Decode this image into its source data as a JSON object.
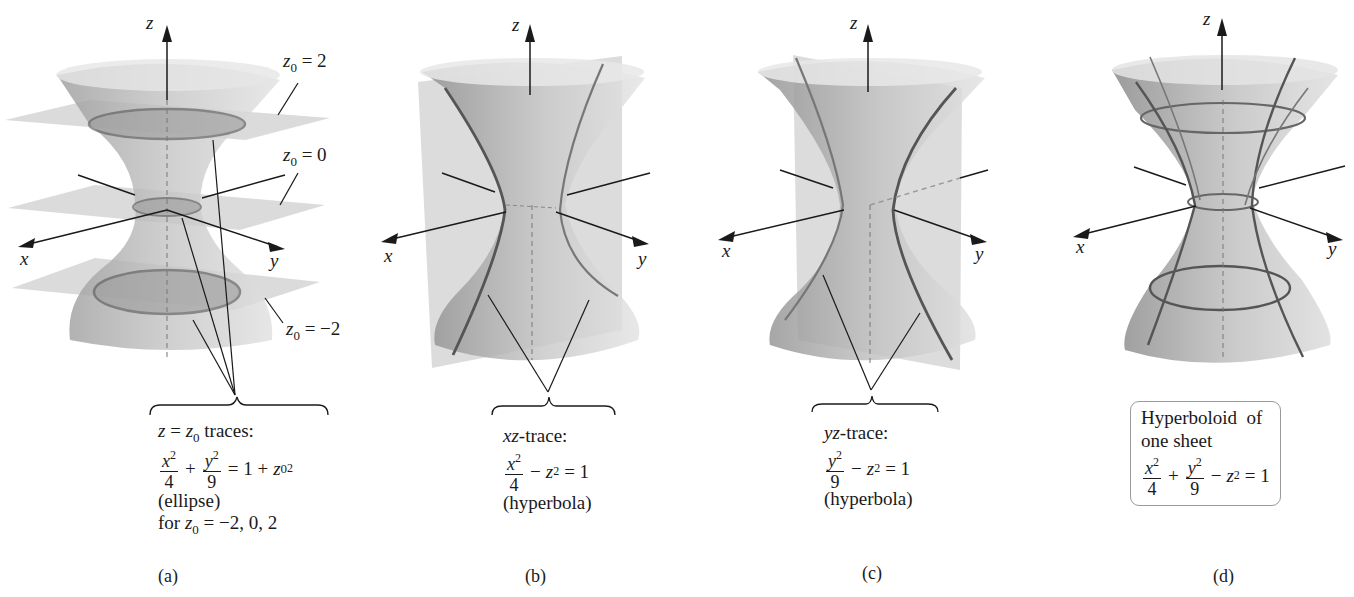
{
  "figure": {
    "panels": [
      {
        "id": "a",
        "caption": "(a)",
        "axes": {
          "x": "x",
          "y": "y",
          "z": "z"
        },
        "plane_labels": [
          {
            "var": "z",
            "sub": "0",
            "rest": "= 2"
          },
          {
            "var": "z",
            "sub": "0",
            "rest": "= 0"
          },
          {
            "var": "z",
            "sub": "0",
            "rest": "= −2"
          }
        ],
        "annotation": {
          "line1_var": "z",
          "line1_eq": "=",
          "line1_sub_var": "z",
          "line1_sub": "0",
          "line1_rest": "traces:",
          "frac1_num": "x",
          "frac1_num_sup": "2",
          "frac1_den": "4",
          "plus": "+",
          "frac2_num": "y",
          "frac2_num_sup": "2",
          "frac2_den": "9",
          "rhs": "= 1 +",
          "rhs_var": "z",
          "rhs_sub": "0",
          "rhs_sup": "2",
          "type": "(ellipse)",
          "for_text": "for",
          "for_var": "z",
          "for_sub": "0",
          "for_rest": "= −2, 0, 2"
        }
      },
      {
        "id": "b",
        "caption": "(b)",
        "axes": {
          "x": "x",
          "y": "y",
          "z": "z"
        },
        "annotation": {
          "title_var": "xz",
          "title_rest": "-trace:",
          "frac_num": "x",
          "frac_num_sup": "2",
          "frac_den": "4",
          "minus": "−",
          "z_var": "z",
          "z_sup": "2",
          "rhs": "= 1",
          "type": "(hyperbola)"
        }
      },
      {
        "id": "c",
        "caption": "(c)",
        "axes": {
          "x": "x",
          "y": "y",
          "z": "z"
        },
        "annotation": {
          "title_var": "yz",
          "title_rest": "-trace:",
          "frac_num": "y",
          "frac_num_sup": "2",
          "frac_den": "9",
          "minus": "−",
          "z_var": "z",
          "z_sup": "2",
          "rhs": "= 1",
          "type": "(hyperbola)"
        }
      },
      {
        "id": "d",
        "caption": "(d)",
        "axes": {
          "x": "x",
          "y": "y",
          "z": "z"
        },
        "box": {
          "line1": "Hyperboloid  of",
          "line2": "one sheet",
          "frac1_num": "x",
          "frac1_num_sup": "2",
          "frac1_den": "4",
          "plus": "+",
          "frac2_num": "y",
          "frac2_num_sup": "2",
          "frac2_den": "9",
          "minus": "−",
          "z_var": "z",
          "z_sup": "2",
          "rhs": "= 1"
        }
      }
    ],
    "colors": {
      "surface_dark": "#8c8c8c",
      "surface_light": "#d9d9d9",
      "plane": "#c8c8c8",
      "trace_line": "#555555",
      "axis": "#1a1a1a"
    }
  }
}
